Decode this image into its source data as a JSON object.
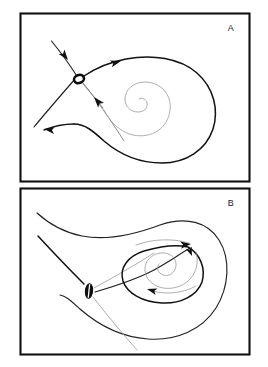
{
  "figure": {
    "background_color": "#ffffff",
    "ink_color": "#111111",
    "width": 268,
    "height": 367
  },
  "panels": [
    {
      "id": "A",
      "label": "A",
      "label_position": {
        "x": 233,
        "y": 29
      },
      "frame": {
        "x": 20,
        "y": 13,
        "width": 230,
        "height": 169
      },
      "description": "Saddle point with homoclinic-like loop and inward spiral",
      "fixed_points": [
        {
          "name": "saddle-point",
          "style": "open-circle",
          "x": 79,
          "y": 79,
          "rx": 5.2,
          "ry": 4.2,
          "rotation": -20
        }
      ],
      "arrowheads": [
        {
          "name": "incoming-stable-arrow",
          "x": 66,
          "y": 58,
          "angle": 52
        },
        {
          "name": "incoming-lower-arrow",
          "x": 98,
          "y": 101,
          "angle": -118
        },
        {
          "name": "outgoing-upper-arrow",
          "x": 116,
          "y": 62,
          "angle": -14
        },
        {
          "name": "outgoing-left-arrow",
          "x": 50,
          "y": 124,
          "angle": 186
        }
      ]
    },
    {
      "id": "B",
      "label": "B",
      "label_position": {
        "x": 233,
        "y": 205
      },
      "frame": {
        "x": 20,
        "y": 188,
        "width": 230,
        "height": 167
      },
      "description": "Saddle point with large closed orbit and interior spiral focus",
      "fixed_points": [
        {
          "name": "saddle-point",
          "style": "filled-ellipse-with-slit",
          "x": 90,
          "y": 291,
          "rx": 3.2,
          "ry": 7.2,
          "rotation": 8
        }
      ],
      "arrowheads": [
        {
          "name": "orbit-upper-right-arrow",
          "x": 187,
          "y": 243,
          "angle": -12
        },
        {
          "name": "orbit-inner-right-arrow",
          "x": 190,
          "y": 254,
          "angle": 62
        },
        {
          "name": "orbit-lower-left-arrow",
          "x": 148,
          "y": 287,
          "angle": 196
        }
      ]
    }
  ],
  "legend": {
    "symbols": [
      {
        "name": "open-circle",
        "meaning": "saddle fixed point (panel A)"
      },
      {
        "name": "filled-ellipse",
        "meaning": "saddle fixed point (panel B)"
      },
      {
        "name": "arrowhead",
        "meaning": "direction of flow along trajectory"
      }
    ]
  }
}
